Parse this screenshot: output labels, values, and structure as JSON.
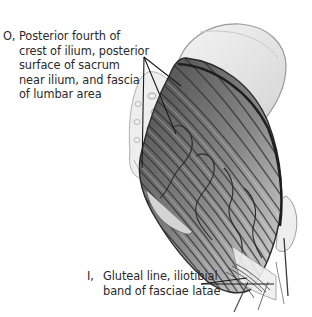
{
  "figure": {
    "colors": {
      "background": "#ffffff",
      "ink": "#2a2a2a",
      "muscle_dark": "#3a3a3a",
      "muscle_light": "#bdbdbd",
      "bone": "#e4e4e4",
      "leader_line": "#1a1a1a"
    }
  },
  "labels": {
    "origin": {
      "prefix": "O,",
      "lines": [
        "Posterior fourth of",
        "crest of ilium, posterior",
        "surface of sacrum",
        "near ilium, and fascia",
        "of lumbar area"
      ]
    },
    "insertion": {
      "prefix": "I,",
      "lines": [
        "Gluteal line, iliotibial",
        "band of fasciae latae"
      ]
    }
  },
  "leader_lines": {
    "origin": {
      "from": [
        144,
        57
      ],
      "to": [
        [
          142,
          168
        ],
        [
          176,
          134
        ],
        [
          181,
          86
        ]
      ]
    },
    "insertion": {
      "from": [
        201,
        284
      ],
      "to": [
        [
          247,
          278
        ],
        [
          274,
          284
        ]
      ]
    }
  }
}
